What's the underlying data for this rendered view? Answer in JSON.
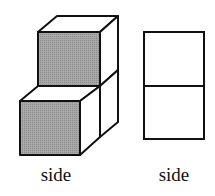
{
  "figure": {
    "left": {
      "description": "two stacked cubes in perspective with shaded front faces",
      "label": "side",
      "shade_color": "#9a9a9a"
    },
    "right": {
      "description": "side view: two stacked squares",
      "label": "side"
    }
  }
}
